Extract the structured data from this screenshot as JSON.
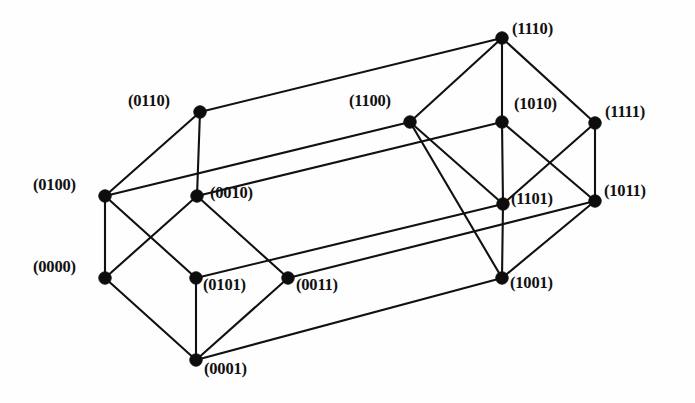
{
  "figure": {
    "background_color": "#fefefe",
    "edge_color": "#111111",
    "vertex_color": "#0d0d0d",
    "width": 695,
    "height": 403
  },
  "chart_data": {
    "type": "diagram",
    "subtype": "graph",
    "vertex_count": 16,
    "edge_count": 32,
    "nodes": [
      {
        "id": "0110",
        "label": "(0110)",
        "x": 200,
        "y": 112,
        "label_x": 128,
        "label_y": 93,
        "label_align": "left"
      },
      {
        "id": "0100",
        "label": "(0100)",
        "x": 105,
        "y": 196,
        "label_x": 33,
        "label_y": 177,
        "label_align": "left"
      },
      {
        "id": "0010",
        "label": "(0010)",
        "x": 197,
        "y": 196,
        "label_x": 210,
        "label_y": 185,
        "label_align": "left"
      },
      {
        "id": "0000",
        "label": "(0000)",
        "x": 105,
        "y": 278,
        "label_x": 33,
        "label_y": 259,
        "label_align": "left"
      },
      {
        "id": "0101",
        "label": "(0101)",
        "x": 196,
        "y": 278,
        "label_x": 203,
        "label_y": 277,
        "label_align": "left"
      },
      {
        "id": "0011",
        "label": "(0011)",
        "x": 288,
        "y": 278,
        "label_x": 296,
        "label_y": 277,
        "label_align": "left"
      },
      {
        "id": "0001",
        "label": "(0001)",
        "x": 196,
        "y": 360,
        "label_x": 204,
        "label_y": 361,
        "label_align": "left"
      },
      {
        "id": "1110",
        "label": "(1110)",
        "x": 502,
        "y": 38,
        "label_x": 512,
        "label_y": 21,
        "label_align": "left"
      },
      {
        "id": "1100",
        "label": "(1100)",
        "x": 410,
        "y": 122,
        "label_x": 349,
        "label_y": 93,
        "label_align": "left"
      },
      {
        "id": "1010",
        "label": "(1010)",
        "x": 502,
        "y": 122,
        "label_x": 514,
        "label_y": 96,
        "label_align": "left"
      },
      {
        "id": "1111",
        "label": "(1111)",
        "x": 595,
        "y": 123,
        "label_x": 605,
        "label_y": 104,
        "label_align": "left"
      },
      {
        "id": "1101",
        "label": "(1101)",
        "x": 503,
        "y": 204,
        "label_x": 511,
        "label_y": 191,
        "label_align": "left"
      },
      {
        "id": "1011",
        "label": "(1011)",
        "x": 595,
        "y": 201,
        "label_x": 604,
        "label_y": 183,
        "label_align": "left"
      },
      {
        "id": "1001",
        "label": "(1001)",
        "x": 502,
        "y": 278,
        "label_x": 510,
        "label_y": 275,
        "label_align": "left"
      }
    ],
    "hidden_nodes": [
      {
        "id": "0111",
        "note": "coincides with 0011 region in this projection"
      },
      {
        "id": "1000",
        "note": "coincides with 1001 region in this projection"
      }
    ],
    "edges": [
      {
        "from": "0110",
        "to": "0100"
      },
      {
        "from": "0110",
        "to": "0010"
      },
      {
        "from": "0110",
        "to": "1110"
      },
      {
        "from": "0100",
        "to": "0000"
      },
      {
        "from": "0100",
        "to": "0101"
      },
      {
        "from": "0100",
        "to": "1100"
      },
      {
        "from": "0010",
        "to": "0000"
      },
      {
        "from": "0010",
        "to": "0011"
      },
      {
        "from": "0010",
        "to": "1010"
      },
      {
        "from": "0000",
        "to": "0001"
      },
      {
        "from": "0101",
        "to": "0001"
      },
      {
        "from": "0101",
        "to": "1101"
      },
      {
        "from": "0011",
        "to": "0001"
      },
      {
        "from": "0011",
        "to": "1011"
      },
      {
        "from": "0001",
        "to": "1001"
      },
      {
        "from": "1110",
        "to": "1100"
      },
      {
        "from": "1110",
        "to": "1010"
      },
      {
        "from": "1110",
        "to": "1111"
      },
      {
        "from": "1100",
        "to": "1101"
      },
      {
        "from": "1100",
        "to": "1001"
      },
      {
        "from": "1010",
        "to": "1011"
      },
      {
        "from": "1010",
        "to": "1101"
      },
      {
        "from": "1111",
        "to": "1011"
      },
      {
        "from": "1111",
        "to": "1101"
      },
      {
        "from": "1101",
        "to": "1001"
      },
      {
        "from": "1011",
        "to": "1001"
      }
    ]
  }
}
